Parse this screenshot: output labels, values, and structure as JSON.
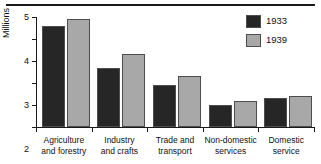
{
  "chart_data": {
    "type": "bar",
    "title": "",
    "xlabel": "",
    "ylabel": "Millions",
    "ylim": [
      0,
      5
    ],
    "yticks": [
      0,
      1,
      2,
      3,
      4,
      5
    ],
    "ytick_labels": [
      "0",
      "1",
      "2",
      "3",
      "4",
      "5"
    ],
    "grid": false,
    "legend_position": "top-right",
    "categories": [
      "Agriculture and forestry",
      "Industry and crafts",
      "Trade and transport",
      "Non-domestic services",
      "Domestic service"
    ],
    "category_lines": [
      [
        "Agriculture",
        "and forestry"
      ],
      [
        "Industry",
        "and crafts"
      ],
      [
        "Trade and",
        "transport"
      ],
      [
        "Non-domestic",
        "services"
      ],
      [
        "Domestic",
        "service"
      ]
    ],
    "series": [
      {
        "name": "1933",
        "color": "#262626",
        "values": [
          4.6,
          2.7,
          1.9,
          1.0,
          1.3
        ]
      },
      {
        "name": "1939",
        "color": "#a8a8a8",
        "values": [
          4.9,
          3.3,
          2.3,
          1.2,
          1.4
        ]
      }
    ]
  },
  "legend": {
    "entries": [
      {
        "label": "1933",
        "color": "#262626"
      },
      {
        "label": "1939",
        "color": "#a8a8a8"
      }
    ]
  }
}
